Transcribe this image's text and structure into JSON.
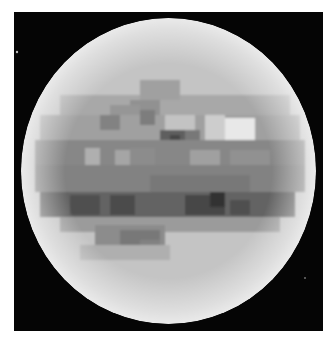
{
  "image": {
    "subject": "pixelated grayscale planetary disk",
    "background_color": "#ffffff",
    "space_color": "#050505",
    "frame": {
      "x": 14,
      "y": 12,
      "w": 309,
      "h": 319
    },
    "disk": {
      "cx": 168.5,
      "cy": 171,
      "rx": 147.5,
      "ry": 153,
      "base_color": "#c4c4c4",
      "limb_color": "#e6e6e6"
    },
    "stars": [
      {
        "x": 17,
        "y": 52,
        "r": 1.2
      },
      {
        "x": 305,
        "y": 278,
        "r": 0.8
      }
    ],
    "features": [
      {
        "x": 60,
        "y": 95,
        "w": 230,
        "h": 20,
        "gray": 168
      },
      {
        "x": 140,
        "y": 80,
        "w": 40,
        "h": 20,
        "gray": 160
      },
      {
        "x": 130,
        "y": 100,
        "w": 30,
        "h": 20,
        "gray": 145
      },
      {
        "x": 110,
        "y": 105,
        "w": 30,
        "h": 15,
        "gray": 150
      },
      {
        "x": 40,
        "y": 115,
        "w": 260,
        "h": 25,
        "gray": 160
      },
      {
        "x": 100,
        "y": 115,
        "w": 20,
        "h": 15,
        "gray": 130
      },
      {
        "x": 140,
        "y": 110,
        "w": 15,
        "h": 15,
        "gray": 125
      },
      {
        "x": 165,
        "y": 115,
        "w": 30,
        "h": 15,
        "gray": 195
      },
      {
        "x": 205,
        "y": 115,
        "w": 20,
        "h": 25,
        "gray": 205
      },
      {
        "x": 225,
        "y": 118,
        "w": 30,
        "h": 22,
        "gray": 232
      },
      {
        "x": 160,
        "y": 130,
        "w": 25,
        "h": 20,
        "gray": 95
      },
      {
        "x": 170,
        "y": 135,
        "w": 10,
        "h": 10,
        "gray": 70
      },
      {
        "x": 185,
        "y": 130,
        "w": 15,
        "h": 15,
        "gray": 120
      },
      {
        "x": 35,
        "y": 140,
        "w": 270,
        "h": 25,
        "gray": 135
      },
      {
        "x": 85,
        "y": 148,
        "w": 15,
        "h": 32,
        "gray": 175
      },
      {
        "x": 115,
        "y": 150,
        "w": 15,
        "h": 20,
        "gray": 165
      },
      {
        "x": 130,
        "y": 148,
        "w": 25,
        "h": 25,
        "gray": 140
      },
      {
        "x": 190,
        "y": 150,
        "w": 30,
        "h": 20,
        "gray": 160
      },
      {
        "x": 230,
        "y": 150,
        "w": 40,
        "h": 20,
        "gray": 145
      },
      {
        "x": 35,
        "y": 165,
        "w": 270,
        "h": 27,
        "gray": 130
      },
      {
        "x": 150,
        "y": 175,
        "w": 100,
        "h": 17,
        "gray": 120
      },
      {
        "x": 40,
        "y": 192,
        "w": 255,
        "h": 25,
        "gray": 100
      },
      {
        "x": 70,
        "y": 195,
        "w": 30,
        "h": 20,
        "gray": 80
      },
      {
        "x": 110,
        "y": 195,
        "w": 25,
        "h": 20,
        "gray": 75
      },
      {
        "x": 185,
        "y": 195,
        "w": 40,
        "h": 20,
        "gray": 70
      },
      {
        "x": 210,
        "y": 192,
        "w": 15,
        "h": 15,
        "gray": 50
      },
      {
        "x": 230,
        "y": 200,
        "w": 20,
        "h": 15,
        "gray": 80
      },
      {
        "x": 60,
        "y": 217,
        "w": 220,
        "h": 15,
        "gray": 155
      },
      {
        "x": 95,
        "y": 225,
        "w": 70,
        "h": 20,
        "gray": 140
      },
      {
        "x": 120,
        "y": 230,
        "w": 40,
        "h": 25,
        "gray": 120
      },
      {
        "x": 140,
        "y": 240,
        "w": 20,
        "h": 20,
        "gray": 130
      },
      {
        "x": 80,
        "y": 245,
        "w": 90,
        "h": 15,
        "gray": 175
      }
    ]
  }
}
